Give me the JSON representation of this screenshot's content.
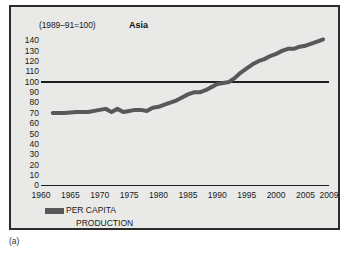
{
  "caption": "(a)",
  "panel": {
    "index_note": "(1989–91=100)",
    "title": "Asia",
    "background_color": "#e9e9e7",
    "border_color": "#2b2b2b"
  },
  "legend": {
    "swatch_color": "#585858",
    "label_line_1": "PER CAPITA",
    "label_line_2": "PRODUCTION"
  },
  "chart_data": {
    "type": "line",
    "title": "Asia",
    "subtitle": "(1989–91=100)",
    "xlabel": "",
    "ylabel": "",
    "xlim": [
      1960,
      2009
    ],
    "ylim": [
      0,
      140
    ],
    "grid": false,
    "reference_lines": [
      {
        "value": 100,
        "axis": "y",
        "color": "#1f1f1f"
      }
    ],
    "legend_position": "bottom-left",
    "xticks": [
      1960,
      1965,
      1970,
      1975,
      1980,
      1985,
      1990,
      1995,
      2000,
      2005,
      2009
    ],
    "xtick_labels": [
      "1960",
      "1965",
      "1970",
      "1975",
      "1980",
      "1985",
      "1990",
      "1995",
      "2000",
      "2005",
      "2009"
    ],
    "yticks": [
      0,
      10,
      20,
      30,
      40,
      50,
      60,
      70,
      80,
      90,
      100,
      110,
      120,
      130,
      140
    ],
    "ytick_labels": [
      "0",
      "10",
      "20",
      "30",
      "40",
      "50",
      "60",
      "70",
      "80",
      "90",
      "100",
      "110",
      "120",
      "130",
      "140"
    ],
    "series": [
      {
        "name": "PER CAPITA PRODUCTION",
        "color": "#585858",
        "line_width": 4,
        "x": [
          1962,
          1964,
          1966,
          1968,
          1970,
          1971,
          1972,
          1973,
          1974,
          1975,
          1976,
          1977,
          1978,
          1979,
          1980,
          1981,
          1982,
          1983,
          1984,
          1985,
          1986,
          1987,
          1988,
          1989,
          1990,
          1991,
          1992,
          1993,
          1994,
          1995,
          1996,
          1997,
          1998,
          1999,
          2000,
          2001,
          2002,
          2003,
          2004,
          2005,
          2006,
          2007,
          2008
        ],
        "values": [
          70,
          70,
          71,
          71,
          73,
          74,
          71,
          74,
          71,
          72,
          73,
          73,
          72,
          75,
          76,
          78,
          80,
          82,
          85,
          88,
          90,
          90,
          92,
          95,
          98,
          99,
          100,
          104,
          109,
          113,
          117,
          120,
          122,
          125,
          127,
          130,
          132,
          132,
          134,
          135,
          137,
          139,
          141
        ]
      }
    ]
  }
}
